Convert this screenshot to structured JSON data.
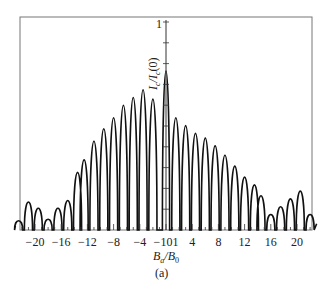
{
  "chart_data": {
    "type": "line",
    "title": "",
    "caption": "(a)",
    "xlabel": "B_a/B_0",
    "ylabel": "I_c/I_c(0)",
    "y_top_tick_label": "1",
    "xlim": [
      -23,
      23
    ],
    "ylim": [
      0,
      1
    ],
    "x_ticks": [
      -20,
      -16,
      -12,
      -8,
      -4,
      -1,
      0,
      1,
      4,
      8,
      12,
      16,
      20
    ],
    "x_tick_labels": [
      "−20",
      "−16",
      "−12",
      "−8",
      "−4",
      "−101",
      "4",
      "8",
      "12",
      "16",
      "20"
    ],
    "grid": false,
    "series": [
      {
        "name": "I_c/I_c(0)",
        "description": "Fraunhofer-like interference pattern: central peak at 0 with value 1, side lobes decreasing away from center, with irregular lobes beyond |B_a/B_0|≈14",
        "peaks": [
          {
            "x": -22.5,
            "y": 0.04
          },
          {
            "x": -21,
            "y": 0.16
          },
          {
            "x": -19.5,
            "y": 0.12
          },
          {
            "x": -18,
            "y": 0.05
          },
          {
            "x": -16.5,
            "y": 0.12
          },
          {
            "x": -15,
            "y": 0.17
          },
          {
            "x": -13.5,
            "y": 0.35
          },
          {
            "x": -12.5,
            "y": 0.43
          },
          {
            "x": -11,
            "y": 0.55
          },
          {
            "x": -9.5,
            "y": 0.63
          },
          {
            "x": -8,
            "y": 0.7
          },
          {
            "x": -6.5,
            "y": 0.78
          },
          {
            "x": -5,
            "y": 0.83
          },
          {
            "x": -3.5,
            "y": 0.88
          },
          {
            "x": -2,
            "y": 0.82
          },
          {
            "x": 0,
            "y": 1.0
          },
          {
            "x": 1.5,
            "y": 0.7
          },
          {
            "x": 3,
            "y": 0.65
          },
          {
            "x": 4.5,
            "y": 0.6
          },
          {
            "x": 6,
            "y": 0.57
          },
          {
            "x": 7.5,
            "y": 0.52
          },
          {
            "x": 9,
            "y": 0.46
          },
          {
            "x": 10.5,
            "y": 0.39
          },
          {
            "x": 12,
            "y": 0.32
          },
          {
            "x": 13.5,
            "y": 0.27
          },
          {
            "x": 14.5,
            "y": 0.2
          },
          {
            "x": 16,
            "y": 0.08
          },
          {
            "x": 17.5,
            "y": 0.13
          },
          {
            "x": 19,
            "y": 0.18
          },
          {
            "x": 20.5,
            "y": 0.23
          },
          {
            "x": 22,
            "y": 0.08
          }
        ]
      }
    ]
  }
}
